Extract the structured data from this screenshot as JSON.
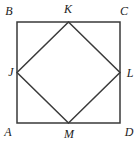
{
  "diagram": {
    "background": "#ffffff",
    "line_color": "#3a3a3a",
    "labels": {
      "outer_top_left": "B",
      "outer_top_right": "C",
      "outer_bottom_left": "A",
      "outer_bottom_right": "D",
      "inner_top": "K",
      "inner_left": "J",
      "inner_right": "L",
      "inner_bottom": "M"
    },
    "shapes": {
      "outer_square_path": "M 17 22 H 120 V 123 H 17 Z",
      "inner_square_path": "M 68.5 22 L 120 72.5 L 68.5 123 L 17 72.5 Z"
    }
  }
}
